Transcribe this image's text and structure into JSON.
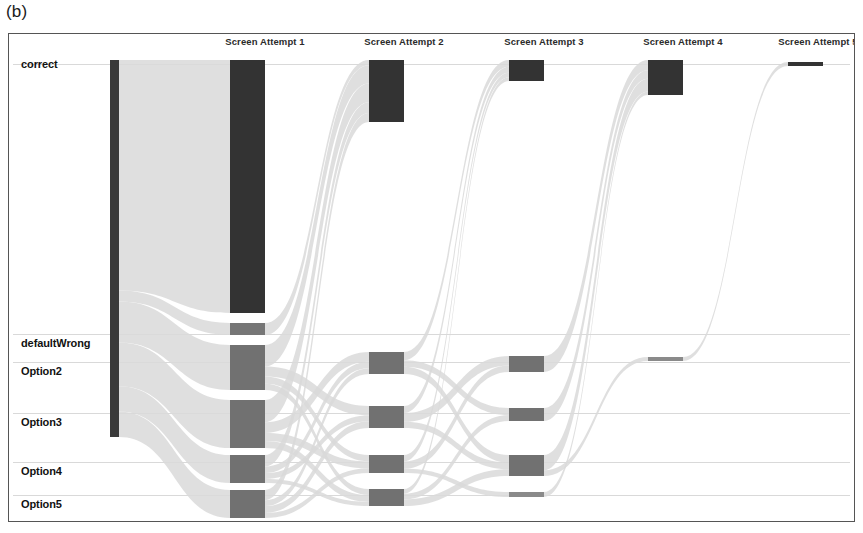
{
  "figure": {
    "panel_label": "(b)",
    "caption_position": "top-left"
  },
  "chart_data": {
    "type": "sankey",
    "title": "",
    "xlabel": "",
    "ylabel": "",
    "grid": true,
    "legend_position": "none",
    "stage_labels": [
      "Screen Attempt 1",
      "Screen Attempt 2",
      "Screen Attempt 3",
      "Screen Attempt 4",
      "Screen Attempt 5"
    ],
    "category_labels": [
      "correct",
      "defaultWrong",
      "Option2",
      "Option3",
      "Option4",
      "Option5"
    ],
    "colors": {
      "node_correct": "#3a3a3a",
      "node_wrong": "#7a7a7a",
      "link": "#d9d9d9",
      "gridline": "#c9c9c9",
      "frame": "#555555",
      "background": "#ffffff"
    },
    "category_rows": {
      "correct": 64,
      "defaultWrong": 334,
      "Option2": 362,
      "Option3": 413,
      "Option4": 462,
      "Option5": 495
    },
    "stage_x": [
      112,
      247,
      386,
      526,
      665,
      800
    ],
    "nodes": [
      {
        "id": "source",
        "stage": 0,
        "category": "source",
        "x": 110,
        "y": 60,
        "w": 9,
        "h": 377,
        "color": "#3a3a3a",
        "value": 1000
      },
      {
        "id": "a1-correct",
        "stage": 1,
        "category": "correct",
        "x": 230,
        "y": 60,
        "w": 35,
        "h": 253,
        "color": "#333333",
        "value": 671
      },
      {
        "id": "a1-defaultWrong",
        "stage": 1,
        "category": "defaultWrong",
        "x": 230,
        "y": 323,
        "w": 35,
        "h": 12,
        "color": "#767676",
        "value": 32
      },
      {
        "id": "a1-option2",
        "stage": 1,
        "category": "Option2",
        "x": 230,
        "y": 345,
        "w": 35,
        "h": 45,
        "color": "#717171",
        "value": 119
      },
      {
        "id": "a1-option3",
        "stage": 1,
        "category": "Option3",
        "x": 230,
        "y": 400,
        "w": 35,
        "h": 48,
        "color": "#717171",
        "value": 127
      },
      {
        "id": "a1-option4",
        "stage": 1,
        "category": "Option4",
        "x": 230,
        "y": 455,
        "w": 35,
        "h": 28,
        "color": "#717171",
        "value": 74
      },
      {
        "id": "a1-option5",
        "stage": 1,
        "category": "Option5",
        "x": 230,
        "y": 490,
        "w": 35,
        "h": 28,
        "color": "#717171",
        "value": 74
      },
      {
        "id": "a2-correct",
        "stage": 2,
        "category": "correct",
        "x": 369,
        "y": 60,
        "w": 35,
        "h": 62,
        "color": "#333333",
        "value": 164
      },
      {
        "id": "a2-option2",
        "stage": 2,
        "category": "Option2",
        "x": 369,
        "y": 352,
        "w": 35,
        "h": 22,
        "color": "#717171",
        "value": 58
      },
      {
        "id": "a2-option3",
        "stage": 2,
        "category": "Option3",
        "x": 369,
        "y": 406,
        "w": 35,
        "h": 22,
        "color": "#717171",
        "value": 58
      },
      {
        "id": "a2-option4",
        "stage": 2,
        "category": "Option4",
        "x": 369,
        "y": 455,
        "w": 35,
        "h": 18,
        "color": "#717171",
        "value": 48
      },
      {
        "id": "a2-option5",
        "stage": 2,
        "category": "Option5",
        "x": 369,
        "y": 489,
        "w": 35,
        "h": 17,
        "color": "#717171",
        "value": 45
      },
      {
        "id": "a3-correct",
        "stage": 3,
        "category": "correct",
        "x": 509,
        "y": 60,
        "w": 35,
        "h": 21,
        "color": "#333333",
        "value": 56
      },
      {
        "id": "a3-option2",
        "stage": 3,
        "category": "Option2",
        "x": 509,
        "y": 356,
        "w": 35,
        "h": 16,
        "color": "#717171",
        "value": 42
      },
      {
        "id": "a3-option3",
        "stage": 3,
        "category": "Option3",
        "x": 509,
        "y": 408,
        "w": 35,
        "h": 13,
        "color": "#717171",
        "value": 34
      },
      {
        "id": "a3-option4",
        "stage": 3,
        "category": "Option4",
        "x": 509,
        "y": 455,
        "w": 35,
        "h": 21,
        "color": "#717171",
        "value": 56
      },
      {
        "id": "a3-option5",
        "stage": 3,
        "category": "Option5",
        "x": 509,
        "y": 492,
        "w": 35,
        "h": 5,
        "color": "#8a8a8a",
        "value": 13
      },
      {
        "id": "a4-correct",
        "stage": 4,
        "category": "correct",
        "x": 648,
        "y": 60,
        "w": 35,
        "h": 35,
        "color": "#333333",
        "value": 93
      },
      {
        "id": "a4-option2",
        "stage": 4,
        "category": "Option2",
        "x": 648,
        "y": 357,
        "w": 35,
        "h": 4,
        "color": "#8a8a8a",
        "value": 11
      },
      {
        "id": "a5-correct",
        "stage": 5,
        "category": "correct",
        "x": 788,
        "y": 62,
        "w": 35,
        "h": 4,
        "color": "#333333",
        "value": 11
      }
    ],
    "links": [
      {
        "source": "source",
        "target": "a1-correct",
        "value": 671
      },
      {
        "source": "source",
        "target": "a1-defaultWrong",
        "value": 32
      },
      {
        "source": "source",
        "target": "a1-option2",
        "value": 119
      },
      {
        "source": "source",
        "target": "a1-option3",
        "value": 127
      },
      {
        "source": "source",
        "target": "a1-option4",
        "value": 74
      },
      {
        "source": "source",
        "target": "a1-option5",
        "value": 74
      },
      {
        "source": "a1-defaultWrong",
        "target": "a2-correct",
        "value": 14
      },
      {
        "source": "a1-option2",
        "target": "a2-correct",
        "value": 48
      },
      {
        "source": "a1-option3",
        "target": "a2-correct",
        "value": 50
      },
      {
        "source": "a1-option4",
        "target": "a2-correct",
        "value": 28
      },
      {
        "source": "a1-option5",
        "target": "a2-correct",
        "value": 24
      },
      {
        "source": "a1-option2",
        "target": "a2-option3",
        "value": 22
      },
      {
        "source": "a1-option2",
        "target": "a2-option4",
        "value": 16
      },
      {
        "source": "a1-option2",
        "target": "a2-option5",
        "value": 14
      },
      {
        "source": "a1-option3",
        "target": "a2-option2",
        "value": 24
      },
      {
        "source": "a1-option3",
        "target": "a2-option4",
        "value": 18
      },
      {
        "source": "a1-option3",
        "target": "a2-option5",
        "value": 16
      },
      {
        "source": "a1-option4",
        "target": "a2-option2",
        "value": 16
      },
      {
        "source": "a1-option4",
        "target": "a2-option3",
        "value": 14
      },
      {
        "source": "a1-option4",
        "target": "a2-option5",
        "value": 10
      },
      {
        "source": "a1-option5",
        "target": "a2-option2",
        "value": 14
      },
      {
        "source": "a1-option5",
        "target": "a2-option3",
        "value": 16
      },
      {
        "source": "a1-option5",
        "target": "a2-option4",
        "value": 12
      },
      {
        "source": "a2-option2",
        "target": "a3-correct",
        "value": 18
      },
      {
        "source": "a2-option3",
        "target": "a3-correct",
        "value": 16
      },
      {
        "source": "a2-option4",
        "target": "a3-correct",
        "value": 12
      },
      {
        "source": "a2-option5",
        "target": "a3-correct",
        "value": 10
      },
      {
        "source": "a2-option2",
        "target": "a3-option3",
        "value": 14
      },
      {
        "source": "a2-option2",
        "target": "a3-option4",
        "value": 16
      },
      {
        "source": "a2-option3",
        "target": "a3-option2",
        "value": 20
      },
      {
        "source": "a2-option3",
        "target": "a3-option4",
        "value": 14
      },
      {
        "source": "a2-option4",
        "target": "a3-option2",
        "value": 14
      },
      {
        "source": "a2-option4",
        "target": "a3-option5",
        "value": 8
      },
      {
        "source": "a2-option5",
        "target": "a3-option3",
        "value": 12
      },
      {
        "source": "a2-option5",
        "target": "a3-option4",
        "value": 14
      },
      {
        "source": "a3-option2",
        "target": "a4-correct",
        "value": 24
      },
      {
        "source": "a3-option3",
        "target": "a4-correct",
        "value": 20
      },
      {
        "source": "a3-option4",
        "target": "a4-correct",
        "value": 30
      },
      {
        "source": "a3-option5",
        "target": "a4-correct",
        "value": 8
      },
      {
        "source": "a3-option4",
        "target": "a4-option2",
        "value": 11
      },
      {
        "source": "a4-option2",
        "target": "a5-correct",
        "value": 11
      }
    ]
  }
}
